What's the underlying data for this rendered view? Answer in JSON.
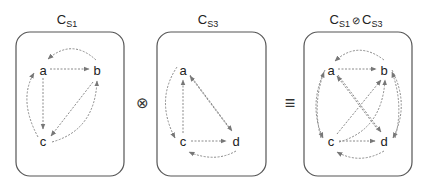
{
  "panels": [
    {
      "id": "cs1",
      "title_main": "C",
      "title_sub": "S1",
      "nodes": {
        "a": "a",
        "b": "b",
        "c": "c"
      }
    },
    {
      "id": "cs3",
      "title_main": "C",
      "title_sub": "S3",
      "nodes": {
        "a": "a",
        "c": "c",
        "d": "d"
      }
    },
    {
      "id": "composed",
      "title_main1": "C",
      "title_sub1": "S1",
      "title_op": "⊘",
      "title_main2": "C",
      "title_sub2": "S3",
      "nodes": {
        "a": "a",
        "b": "b",
        "c": "c",
        "d": "d"
      }
    }
  ],
  "operators": {
    "tensor": "⊗",
    "equiv": "≡"
  },
  "edges": {
    "cs1": [
      [
        "a",
        "b"
      ],
      [
        "b",
        "a"
      ],
      [
        "a",
        "c"
      ],
      [
        "c",
        "a"
      ],
      [
        "b",
        "c"
      ],
      [
        "c",
        "b"
      ]
    ],
    "cs3": [
      [
        "c",
        "a"
      ],
      [
        "a",
        "c"
      ],
      [
        "a",
        "d"
      ],
      [
        "d",
        "a"
      ],
      [
        "c",
        "d"
      ],
      [
        "d",
        "c"
      ]
    ],
    "composed": [
      [
        "a",
        "b"
      ],
      [
        "b",
        "a"
      ],
      [
        "a",
        "c"
      ],
      [
        "c",
        "a"
      ],
      [
        "c",
        "b"
      ],
      [
        "b",
        "c"
      ],
      [
        "a",
        "d"
      ],
      [
        "d",
        "a"
      ],
      [
        "c",
        "d"
      ],
      [
        "d",
        "c"
      ],
      [
        "b",
        "d"
      ],
      [
        "d",
        "b"
      ]
    ]
  },
  "colors": {
    "box": "#555555",
    "edge": "#8a8a8a",
    "text": "#222222"
  }
}
